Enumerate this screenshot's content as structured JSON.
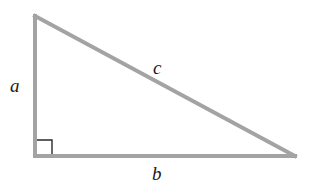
{
  "diagram": {
    "type": "right-triangle",
    "colors": {
      "side": "#a3a3a3",
      "right_angle_marker": "#2a2a2a",
      "label": "#1a1a1a",
      "background": "#ffffff"
    },
    "vertices": {
      "top": [
        35,
        16
      ],
      "right_angle": [
        35,
        156
      ],
      "right": [
        295,
        156
      ]
    },
    "right_angle_marker": {
      "x": 36,
      "y": 140,
      "size": 16
    },
    "labels": {
      "a": "a",
      "b": "b",
      "c": "c"
    }
  }
}
